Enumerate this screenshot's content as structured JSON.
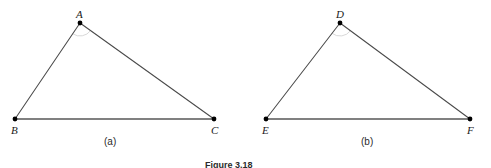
{
  "figure": {
    "caption": "Figure 3.18",
    "background_color": "#ffffff",
    "stroke_color": "#4a4a4a",
    "baseline_color": "#808080",
    "vertex_color": "#000000",
    "label_color": "#1a1a1a"
  },
  "panels": [
    {
      "id": "panel-a",
      "label": "(a)",
      "label_x": 113,
      "label_y": 142,
      "triangle": {
        "name": "triangle-abc",
        "vertices": [
          {
            "name": "A",
            "x": 80,
            "y": 23,
            "label_dx": -4,
            "label_dy": -14
          },
          {
            "name": "B",
            "x": 15,
            "y": 119,
            "label_dx": -4,
            "label_dy": 6
          },
          {
            "name": "C",
            "x": 214,
            "y": 119,
            "label_dx": -3,
            "label_dy": 6
          }
        ],
        "edges": [
          {
            "name": "edge-AB",
            "from": 0,
            "to": 1,
            "kind": "thin"
          },
          {
            "name": "edge-AC",
            "from": 0,
            "to": 2,
            "kind": "thin"
          },
          {
            "name": "edge-BC",
            "from": 1,
            "to": 2,
            "kind": "base"
          }
        ],
        "angle_arc": {
          "at": 0,
          "radius": 13
        }
      }
    },
    {
      "id": "panel-b",
      "label": "(b)",
      "label_x": 370,
      "label_y": 142,
      "triangle": {
        "name": "triangle-def",
        "vertices": [
          {
            "name": "D",
            "x": 340,
            "y": 23,
            "label_dx": -4,
            "label_dy": -14
          },
          {
            "name": "E",
            "x": 266,
            "y": 119,
            "label_dx": -4,
            "label_dy": 6
          },
          {
            "name": "F",
            "x": 470,
            "y": 119,
            "label_dx": -3,
            "label_dy": 6
          }
        ],
        "edges": [
          {
            "name": "edge-DE",
            "from": 0,
            "to": 1,
            "kind": "thin"
          },
          {
            "name": "edge-DF",
            "from": 0,
            "to": 2,
            "kind": "thin"
          },
          {
            "name": "edge-EF",
            "from": 1,
            "to": 2,
            "kind": "base"
          }
        ],
        "angle_arc": {
          "at": 0,
          "radius": 13
        }
      }
    }
  ]
}
